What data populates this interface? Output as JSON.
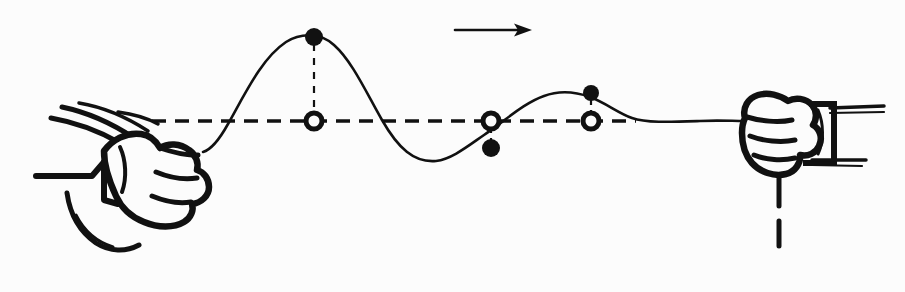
{
  "figure": {
    "title": "Transverse wave pulse travelling along a rope",
    "background_color": "#fcfcfc",
    "ink_color": "#111111",
    "width": 905,
    "height": 292
  },
  "annotations": {
    "direction_arrow": {
      "label": "direction-of-wave-travel",
      "x1": 455,
      "y1": 30,
      "x2": 532,
      "y2": 30,
      "points": "right"
    }
  },
  "equilibrium_line": {
    "label": "equilibrium-axis",
    "y": 121,
    "x_start": 152,
    "x_end": 636,
    "style": "dashed",
    "dash": "14 9",
    "stroke_width": 3.4
  },
  "rope": {
    "label": "rope-wave",
    "stroke_width": 2.6,
    "path": "M 203 152 C 210 150 218 142 228 124 C 246 92 262 58 286 42 C 300 33 320 32 334 45 C 352 61 366 92 382 120 C 398 148 414 163 436 161 C 452 159 468 146 484 135 C 506 120 524 103 544 96 C 560 90 576 92 590 97 C 606 103 618 113 632 118 C 646 123 670 122 700 121 C 718 120 732 121 744 121",
    "tail_path": "M 744 121 L 776 121",
    "loose_end_path": "M 779 164 L 779 206 M 779 221 L 779 246"
  },
  "markers": [
    {
      "id": "crest-particle-1",
      "name": "crest-displacement-marker",
      "type": "filled",
      "x": 314,
      "y": 37,
      "r": 9,
      "connector": {
        "from_y": 37,
        "to_y": 121
      }
    },
    {
      "id": "axis-point-1",
      "name": "equilibrium-position-marker",
      "type": "open",
      "x": 314,
      "y": 121,
      "r": 8
    },
    {
      "id": "axis-point-2",
      "name": "equilibrium-position-marker",
      "type": "open",
      "x": 491,
      "y": 121,
      "r": 8
    },
    {
      "id": "trough-particle-1",
      "name": "trough-displacement-marker",
      "type": "filled",
      "x": 491,
      "y": 148,
      "r": 9,
      "connector": {
        "from_y": 121,
        "to_y": 148
      }
    },
    {
      "id": "crest-particle-2",
      "name": "crest-displacement-marker",
      "type": "filled",
      "x": 591,
      "y": 93,
      "r": 8,
      "connector": {
        "from_y": 93,
        "to_y": 121
      }
    },
    {
      "id": "axis-point-3",
      "name": "equilibrium-position-marker",
      "type": "open",
      "x": 591,
      "y": 121,
      "r": 8
    }
  ],
  "hands": {
    "left": {
      "label": "left-hand-shaking-rope",
      "description": "fist gripping the rope, wrist and sleeve drawn with motion lines",
      "fist_outline": "M 104 151 C 112 140 126 132 141 134 C 150 135 156 141 160 148 C 168 143 180 143 189 150 C 196 155 199 163 197 170 C 204 172 209 179 209 187 C 209 196 201 203 192 204 C 194 210 191 218 184 222 C 174 228 158 228 144 222 C 131 217 121 207 116 196 C 110 183 104 168 104 151 Z",
      "knuckle_lines": [
        "M 160 148 C 172 152 186 156 198 155",
        "M 156 172 C 168 177 184 180 197 178",
        "M 152 196 C 164 201 178 204 191 202"
      ],
      "thumb_line": "M 120 147 C 126 160 127 178 122 192",
      "motion_lines": [
        "M 51 118 C 74 122 99 131 120 143",
        "M 62 107 C 86 112 113 124 134 138",
        "M 79 103 C 103 107 128 118 148 131",
        "M 118 112 C 133 114 147 118 158 124"
      ],
      "cuff_path": "M 36 176 L 92 176 L 104 162",
      "wrist_path": "M 104 162 L 104 200 L 118 204",
      "loose_rope": "M 67 193 C 70 214 80 232 96 243 C 110 252 126 252 139 245",
      "loose_rope_2": "M 76 215 C 84 231 97 242 113 247"
    },
    "right": {
      "label": "right-hand-holding-rope-end",
      "description": "fist holding the far end of the rope, with cuff lines",
      "fist_outline": "M 745 118 C 742 108 748 98 758 95 C 768 92 780 95 788 101 C 795 97 806 98 812 105 C 817 111 817 119 813 125 C 820 129 823 138 819 146 C 816 153 808 157 800 155 C 801 163 795 172 786 174 C 774 177 760 172 752 163 C 745 155 742 144 742 133 C 742 127 743 122 745 118 Z",
      "knuckle_lines": [
        "M 747 117 C 760 121 778 123 792 120",
        "M 750 136 C 763 141 781 143 795 140",
        "M 754 155 C 766 160 782 161 795 158"
      ],
      "cuff_box": "M 812 104 L 834 104 L 834 163 L 806 163",
      "inner_cuff": "M 818 110 C 824 124 824 141 818 154",
      "sleeve_lines": [
        "M 830 108 L 884 106",
        "M 830 113 L 884 112",
        "M 812 160 L 866 160",
        "M 812 165 L 862 166"
      ]
    }
  },
  "chart_data": {
    "type": "line",
    "xlabel": "position along rope",
    "ylabel": "transverse displacement",
    "grid": false,
    "legend": "none",
    "axis_line_y": 121,
    "series": [
      {
        "name": "rope-displacement",
        "x": [
          203,
          228,
          260,
          286,
          314,
          345,
          368,
          391,
          420,
          455,
          491,
          520,
          552,
          591,
          618,
          640,
          700,
          744
        ],
        "y": [
          152,
          124,
          60,
          42,
          37,
          48,
          78,
          110,
          142,
          156,
          148,
          118,
          97,
          93,
          110,
          120,
          121,
          121
        ]
      }
    ],
    "annotated_points": [
      {
        "label": "crest",
        "x": 314,
        "y": 37,
        "marker": "filled"
      },
      {
        "label": "equilibrium",
        "x": 314,
        "y": 121,
        "marker": "open"
      },
      {
        "label": "equilibrium",
        "x": 491,
        "y": 121,
        "marker": "open"
      },
      {
        "label": "trough",
        "x": 491,
        "y": 148,
        "marker": "filled"
      },
      {
        "label": "crest",
        "x": 591,
        "y": 93,
        "marker": "filled"
      },
      {
        "label": "equilibrium",
        "x": 591,
        "y": 121,
        "marker": "open"
      }
    ]
  }
}
